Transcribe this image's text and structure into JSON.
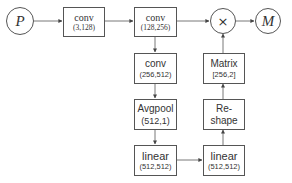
{
  "diagram": {
    "nodes": {
      "input": {
        "label": "P",
        "shape": "circle"
      },
      "conv1": {
        "title": "conv",
        "params": "(3,128)"
      },
      "conv2": {
        "title": "conv",
        "params": "(128,256)"
      },
      "multiply": {
        "label": "×",
        "shape": "circle"
      },
      "output": {
        "label": "M",
        "shape": "circle"
      },
      "conv3": {
        "title": "conv",
        "params": "(256,512)"
      },
      "avgpool": {
        "title": "Avgpool",
        "params": "(512,1)"
      },
      "linear1": {
        "title": "linear",
        "params": "(512,512)"
      },
      "linear2": {
        "title": "linear",
        "params": "(512,512)"
      },
      "reshape": {
        "title": "Re-",
        "title2": "shape"
      },
      "matrix": {
        "title": "Matrix",
        "params": "[256,2]"
      }
    },
    "edges": [
      [
        "input",
        "conv1"
      ],
      [
        "conv1",
        "conv2"
      ],
      [
        "conv2",
        "multiply"
      ],
      [
        "multiply",
        "output"
      ],
      [
        "conv2",
        "conv3"
      ],
      [
        "conv3",
        "avgpool"
      ],
      [
        "avgpool",
        "linear1"
      ],
      [
        "linear1",
        "linear2"
      ],
      [
        "linear2",
        "reshape"
      ],
      [
        "reshape",
        "matrix"
      ],
      [
        "matrix",
        "multiply"
      ]
    ],
    "colors": {
      "stroke": "#555555",
      "text": "#333333",
      "background": "#ffffff"
    }
  }
}
